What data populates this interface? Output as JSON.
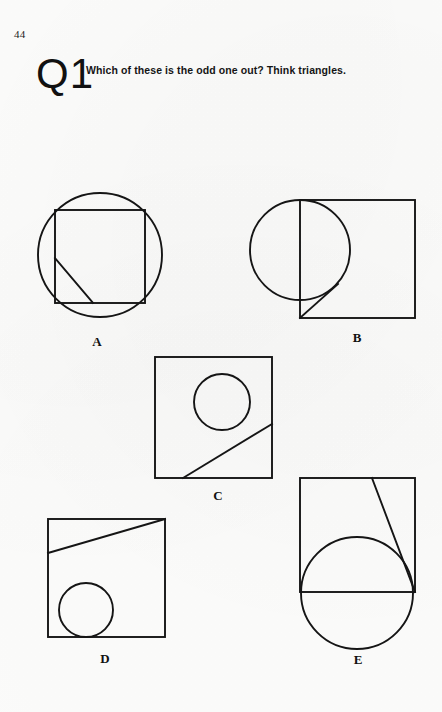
{
  "page": {
    "number": "44",
    "question_id": "Q1",
    "question_text": "Which of these is the odd one out? Think triangles.",
    "background_color": "#fdfdfc",
    "ink_color": "#151515"
  },
  "figures": [
    {
      "label": "A",
      "description": "Circle with an inscribed square; a diagonal from the square's left edge to its bottom edge forms a right triangle in the lower-left.",
      "label_x": 97,
      "label_y": 343,
      "shapes": {
        "circle": {
          "cx": 100,
          "cy": 255,
          "r": 62
        },
        "square": {
          "x": 55,
          "y": 210,
          "w": 90,
          "h": 93
        },
        "diagonal": {
          "x1": 55,
          "y1": 258,
          "x2": 93,
          "y2": 303
        }
      }
    },
    {
      "label": "B",
      "description": "Square with a circle centred on its left edge; a diagonal from the square's bottom-left corner meets the circle's lower-right arc.",
      "label_x": 357,
      "label_y": 339,
      "shapes": {
        "square": {
          "x": 300,
          "y": 200,
          "w": 115,
          "h": 118
        },
        "circle": {
          "cx": 300,
          "cy": 250,
          "r": 50
        },
        "diagonal": {
          "x1": 300,
          "y1": 318,
          "x2": 338,
          "y2": 284
        }
      }
    },
    {
      "label": "C",
      "description": "Square containing a circle in the upper right; a diagonal runs from the bottom edge up to the right edge, tangent to the circle.",
      "label_x": 218,
      "label_y": 497,
      "shapes": {
        "square": {
          "x": 155,
          "y": 357,
          "w": 117,
          "h": 121
        },
        "circle": {
          "cx": 222,
          "cy": 402,
          "r": 28
        },
        "diagonal": {
          "x1": 183,
          "y1": 478,
          "x2": 272,
          "y2": 424
        }
      }
    },
    {
      "label": "D",
      "description": "Square with a diagonal from the left edge to the top-right corner, and a circle resting in the lower-left corner.",
      "label_x": 105,
      "label_y": 660,
      "shapes": {
        "square": {
          "x": 48,
          "y": 519,
          "w": 117,
          "h": 118
        },
        "diagonal": {
          "x1": 48,
          "y1": 553,
          "x2": 165,
          "y2": 519
        },
        "circle": {
          "cx": 86,
          "cy": 610,
          "r": 27
        }
      }
    },
    {
      "label": "E",
      "description": "Square with a large circle crossing its bottom edge; a diagonal from the top edge runs to the bottom-right corner, tangent to the circle.",
      "label_x": 358,
      "label_y": 661,
      "shapes": {
        "square": {
          "x": 300,
          "y": 478,
          "w": 115,
          "h": 114
        },
        "circle": {
          "cx": 357,
          "cy": 593,
          "r": 56
        },
        "diagonal": {
          "x1": 372,
          "y1": 478,
          "x2": 415,
          "y2": 592
        }
      }
    }
  ]
}
